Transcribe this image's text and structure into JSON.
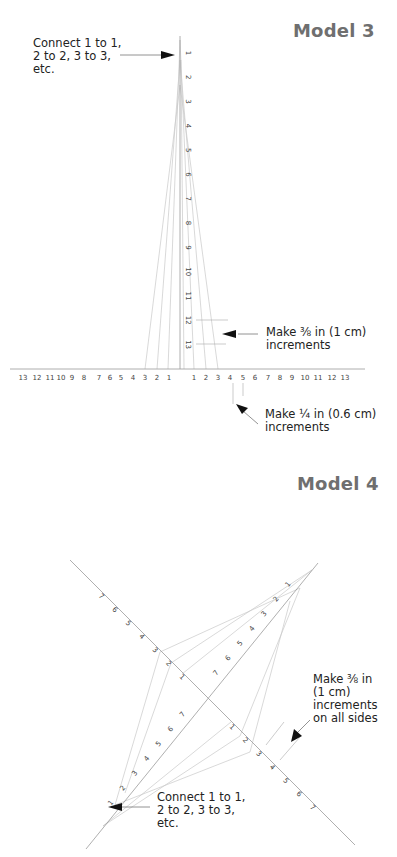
{
  "model3": {
    "title": "Model 3",
    "note_connect": "Connect 1 to 1,\n2 to 2, 3 to 3,\netc.",
    "note_vertical_increments": "Make ⅜ in (1 cm)\nincrements",
    "note_horizontal_increments": "Make ¼ in (0.6 cm)\nincrements",
    "vertical_ticks": [
      "1",
      "2",
      "3",
      "4",
      "5",
      "6",
      "7",
      "8",
      "9",
      "10",
      "11",
      "12",
      "13"
    ],
    "horizontal_left_ticks": [
      "13",
      "12",
      "11",
      "10",
      "9",
      "8",
      "7",
      "6",
      "5",
      "4",
      "3",
      "2",
      "1"
    ],
    "horizontal_right_ticks": [
      "1",
      "2",
      "3",
      "4",
      "5",
      "6",
      "7",
      "8",
      "9",
      "10",
      "11",
      "12",
      "13"
    ]
  },
  "model4": {
    "title": "Model 4",
    "note_increments": "Make ⅜ in\n(1 cm)\nincrements\non all sides",
    "note_connect": "Connect 1 to 1,\n2 to 2, 3 to 3,\netc.",
    "arm_ticks": [
      "1",
      "2",
      "3",
      "4",
      "5",
      "6",
      "7"
    ]
  },
  "colors": {
    "axis": "#9a9a9a",
    "string_line": "#c8c8c8",
    "title": "#6f6f6f",
    "text": "#222222",
    "arrow": "#111111"
  }
}
